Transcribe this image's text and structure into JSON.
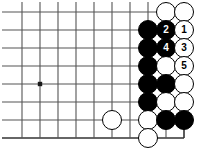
{
  "figure": {
    "kind": "go-board-diagram",
    "width": 204,
    "height": 151,
    "background_color": "#ffffff"
  },
  "board": {
    "line_color": "#555555",
    "edge_color": "#333333",
    "cell_size": 18,
    "origin_x": 22,
    "origin_y": 12,
    "columns": 10,
    "rows": 8,
    "right_edge_is_board_edge": true,
    "bottom_edge_is_board_edge": true,
    "star_points": [
      {
        "col": 1,
        "row": 4,
        "name": "star-point-left"
      }
    ]
  },
  "stones": [
    {
      "id": "w-a",
      "color": "white",
      "col": 8,
      "row": 0,
      "label": ""
    },
    {
      "id": "w-b",
      "color": "white",
      "col": 9,
      "row": 0,
      "label": ""
    },
    {
      "id": "b-a",
      "color": "black",
      "col": 7,
      "row": 1,
      "label": ""
    },
    {
      "id": "b-2",
      "color": "black",
      "col": 8,
      "row": 1,
      "label": "2"
    },
    {
      "id": "w-1",
      "color": "white",
      "col": 9,
      "row": 1,
      "label": "1"
    },
    {
      "id": "b-b",
      "color": "black",
      "col": 7,
      "row": 2,
      "label": ""
    },
    {
      "id": "b-4",
      "color": "black",
      "col": 8,
      "row": 2,
      "label": "4"
    },
    {
      "id": "w-3",
      "color": "white",
      "col": 9,
      "row": 2,
      "label": "3"
    },
    {
      "id": "b-c",
      "color": "black",
      "col": 7,
      "row": 3,
      "label": ""
    },
    {
      "id": "w-c",
      "color": "white",
      "col": 8,
      "row": 3,
      "label": ""
    },
    {
      "id": "w-5",
      "color": "white",
      "col": 9,
      "row": 3,
      "label": "5"
    },
    {
      "id": "b-d",
      "color": "black",
      "col": 7,
      "row": 4,
      "label": ""
    },
    {
      "id": "b-e",
      "color": "black",
      "col": 8,
      "row": 4,
      "label": ""
    },
    {
      "id": "w-d",
      "color": "white",
      "col": 9,
      "row": 4,
      "label": ""
    },
    {
      "id": "b-f",
      "color": "black",
      "col": 7,
      "row": 5,
      "label": ""
    },
    {
      "id": "w-e",
      "color": "white",
      "col": 8,
      "row": 5,
      "label": ""
    },
    {
      "id": "w-f",
      "color": "white",
      "col": 9,
      "row": 5,
      "label": ""
    },
    {
      "id": "w-g",
      "color": "white",
      "col": 5,
      "row": 6,
      "label": ""
    },
    {
      "id": "w-h",
      "color": "white",
      "col": 7,
      "row": 6,
      "label": ""
    },
    {
      "id": "b-g",
      "color": "black",
      "col": 8,
      "row": 6,
      "label": ""
    },
    {
      "id": "b-h",
      "color": "black",
      "col": 9,
      "row": 6,
      "label": ""
    },
    {
      "id": "w-i",
      "color": "white",
      "col": 7,
      "row": 7,
      "label": ""
    }
  ],
  "move_sequence": [
    {
      "number": "1",
      "color": "white"
    },
    {
      "number": "2",
      "color": "black"
    },
    {
      "number": "3",
      "color": "white"
    },
    {
      "number": "4",
      "color": "black"
    },
    {
      "number": "5",
      "color": "white"
    }
  ]
}
